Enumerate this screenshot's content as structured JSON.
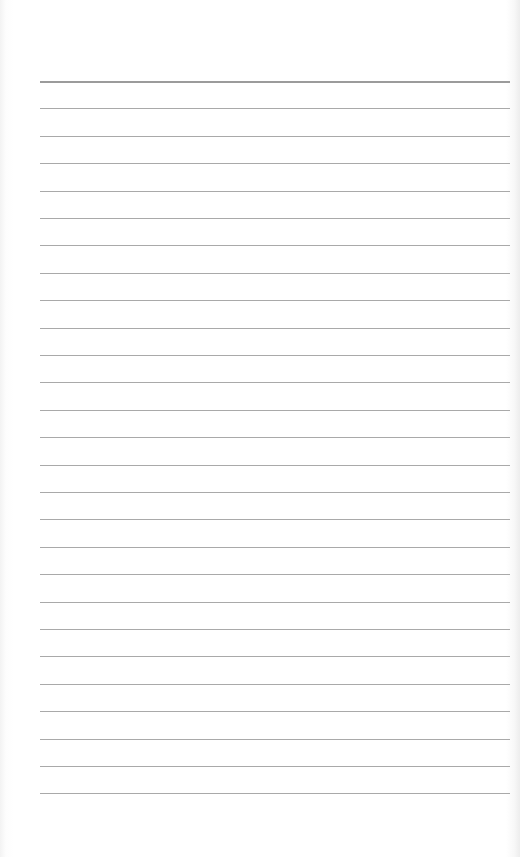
{
  "page": {
    "type": "blank lined paper",
    "line_count": 27,
    "first_line_y": 81,
    "line_spacing": 27.4,
    "line_left": 40,
    "line_right": 510,
    "line_color": "#9a9a9a",
    "first_line_color": "#8a8a8a",
    "paper_color": "#ffffff"
  }
}
